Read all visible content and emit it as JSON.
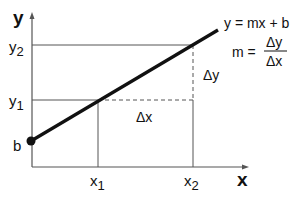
{
  "diagram": {
    "type": "linear-function-slope",
    "axes": {
      "x_label": "x",
      "y_label": "y"
    },
    "y_ticks": [
      {
        "main": "y",
        "sub": "2"
      },
      {
        "main": "y",
        "sub": "1"
      }
    ],
    "x_ticks": [
      {
        "main": "x",
        "sub": "1"
      },
      {
        "main": "x",
        "sub": "2"
      }
    ],
    "intercept_label": "b",
    "equation": "y = mx + b",
    "slope_formula": {
      "lhs": "m =",
      "numerator": "Δy",
      "denominator": "Δx"
    },
    "delta_x_label": "Δx",
    "delta_y_label": "Δy",
    "colors": {
      "line": "#111111",
      "axes": "#555555",
      "guides": "#555555",
      "background": "#ffffff"
    }
  }
}
